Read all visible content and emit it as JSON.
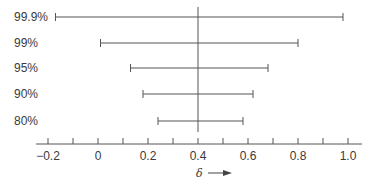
{
  "chart_data": {
    "type": "interval",
    "title": "",
    "xlabel": "δ",
    "ylabel": "",
    "xlim": [
      -0.25,
      1.05
    ],
    "x_ticks": [
      -0.2,
      0,
      0.2,
      0.4,
      0.6,
      0.8,
      1.0
    ],
    "x_tick_labels": [
      "−0.2",
      "0",
      "0.2",
      "0.4",
      "0.6",
      "0.8",
      "1.0"
    ],
    "minor_ticks": [
      -0.1,
      0.1,
      0.3,
      0.5,
      0.7,
      0.9
    ],
    "reference_line": 0.4,
    "grid": false,
    "legend": null,
    "categories": [
      "99.9%",
      "99%",
      "95%",
      "90%",
      "80%"
    ],
    "intervals": [
      {
        "label": "99.9%",
        "lower": -0.17,
        "upper": 0.98
      },
      {
        "label": "99%",
        "lower": 0.01,
        "upper": 0.8
      },
      {
        "label": "95%",
        "lower": 0.13,
        "upper": 0.68
      },
      {
        "label": "90%",
        "lower": 0.18,
        "upper": 0.62
      },
      {
        "label": "80%",
        "lower": 0.24,
        "upper": 0.58
      }
    ]
  },
  "colors": {
    "line": "#555555",
    "text": "#3a3a3a"
  }
}
